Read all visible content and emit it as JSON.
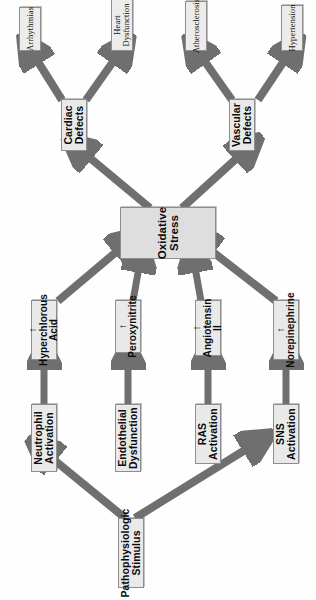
{
  "diagram": {
    "type": "flowchart",
    "orientation": "rotated-90-ccw",
    "colors": {
      "node_fill": "#e9e9e9",
      "node_border": "#8e8e8e",
      "center_fill": "#dedede",
      "arrow": "#6f6f6f",
      "text": "#0b0b0b",
      "background": "#ffffff"
    },
    "nodes": {
      "stimulus": {
        "label": "Pathophysiologic Stimulus"
      },
      "activations": [
        {
          "id": "sns",
          "label": "SNS Activation"
        },
        {
          "id": "ras",
          "label": "RAS Activation"
        },
        {
          "id": "endothelial",
          "label": "Endothelial Dysfunction"
        },
        {
          "id": "neutrophil",
          "label": "Neutrophil Activation"
        }
      ],
      "mediators": [
        {
          "id": "norepinephrine",
          "label": "↑ Norepinephrine"
        },
        {
          "id": "angiotensin",
          "label": "↑ Angiotensin II"
        },
        {
          "id": "peroxynitrite",
          "label": "↑ Peroxynitrite"
        },
        {
          "id": "hyperchlorous",
          "label": "↑ Hyperchlorous Acid"
        }
      ],
      "center": {
        "id": "oxidative-stress",
        "label": "Oxidative Stress"
      },
      "defects": [
        {
          "id": "vascular",
          "label": "Vascular Defects"
        },
        {
          "id": "cardiac",
          "label": "Cardiac Defects"
        }
      ],
      "outcomes": [
        {
          "id": "hypertension",
          "label": "Hypertension",
          "parent": "vascular"
        },
        {
          "id": "atherosclerosis",
          "label": "Atherosclerosis",
          "parent": "vascular"
        },
        {
          "id": "heart-dysfunction",
          "label": "Heart Dysfunction",
          "parent": "cardiac"
        },
        {
          "id": "arrhythmias",
          "label": "Arrhythmias",
          "parent": "cardiac"
        }
      ]
    },
    "edges": [
      {
        "from": "stimulus",
        "to": "sns"
      },
      {
        "from": "stimulus",
        "to": "neutrophil"
      },
      {
        "from": "sns",
        "to": "norepinephrine"
      },
      {
        "from": "ras",
        "to": "angiotensin"
      },
      {
        "from": "endothelial",
        "to": "peroxynitrite"
      },
      {
        "from": "neutrophil",
        "to": "hyperchlorous"
      },
      {
        "from": "norepinephrine",
        "to": "oxidative-stress"
      },
      {
        "from": "angiotensin",
        "to": "oxidative-stress"
      },
      {
        "from": "peroxynitrite",
        "to": "oxidative-stress"
      },
      {
        "from": "hyperchlorous",
        "to": "oxidative-stress"
      },
      {
        "from": "oxidative-stress",
        "to": "vascular"
      },
      {
        "from": "oxidative-stress",
        "to": "cardiac"
      },
      {
        "from": "vascular",
        "to": "hypertension"
      },
      {
        "from": "vascular",
        "to": "atherosclerosis"
      },
      {
        "from": "cardiac",
        "to": "heart-dysfunction"
      },
      {
        "from": "cardiac",
        "to": "arrhythmias"
      }
    ]
  }
}
